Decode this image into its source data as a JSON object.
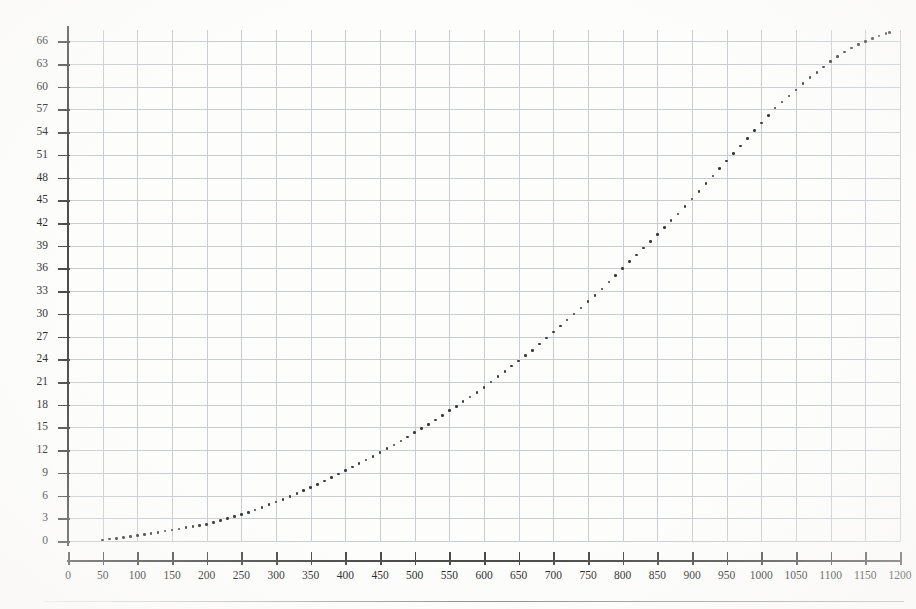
{
  "figure": {
    "kind": "scanned-scatter-plot",
    "background_color": "#fdfdfc",
    "grid_color": "#c9cdd3",
    "axis_color": "#4a4a4a",
    "marker_color": "#3a3a3a"
  },
  "chart_data": {
    "type": "scatter",
    "title": "",
    "subtitle": "",
    "xlabel": "",
    "ylabel": "",
    "xlim": [
      0,
      1200
    ],
    "ylim": [
      0,
      67.5
    ],
    "grid": true,
    "legend": null,
    "annotations": [],
    "xticks": [
      0,
      50,
      100,
      150,
      200,
      250,
      300,
      350,
      400,
      450,
      500,
      550,
      600,
      650,
      700,
      750,
      800,
      850,
      900,
      950,
      1000,
      1050,
      1100,
      1150,
      1200
    ],
    "xtick_labels": [
      "0",
      "50",
      "100",
      "150",
      "200",
      "250",
      "300",
      "350",
      "400",
      "450",
      "500",
      "550",
      "600",
      "650",
      "700",
      "750",
      "800",
      "850",
      "900",
      "950",
      "1000",
      "1050",
      "1100",
      "1150",
      "1200"
    ],
    "yticks": [
      0,
      3,
      6,
      9,
      12,
      15,
      18,
      21,
      24,
      27,
      30,
      33,
      36,
      39,
      42,
      45,
      48,
      51,
      54,
      57,
      60,
      63,
      66
    ],
    "ytick_labels": [
      "0",
      "3",
      "6",
      "9",
      "12",
      "15",
      "18",
      "21",
      "24",
      "27",
      "30",
      "33",
      "36",
      "39",
      "42",
      "45",
      "48",
      "51",
      "54",
      "57",
      "60",
      "63",
      "66"
    ],
    "x": [
      50,
      60,
      70,
      80,
      90,
      100,
      110,
      120,
      130,
      140,
      150,
      160,
      170,
      180,
      190,
      200,
      210,
      220,
      230,
      240,
      250,
      260,
      270,
      280,
      290,
      300,
      310,
      320,
      330,
      340,
      350,
      360,
      370,
      380,
      390,
      400,
      410,
      420,
      430,
      440,
      450,
      460,
      470,
      480,
      490,
      500,
      510,
      520,
      530,
      540,
      550,
      560,
      570,
      580,
      590,
      600,
      610,
      620,
      630,
      640,
      650,
      660,
      670,
      680,
      690,
      700,
      710,
      720,
      730,
      740,
      750,
      760,
      770,
      780,
      790,
      800,
      810,
      820,
      830,
      840,
      850,
      860,
      870,
      880,
      890,
      900,
      910,
      920,
      930,
      940,
      950,
      960,
      970,
      980,
      990,
      1000,
      1010,
      1020,
      1030,
      1040,
      1050,
      1060,
      1070,
      1080,
      1090,
      1100,
      1110,
      1120,
      1130,
      1140,
      1150,
      1160,
      1170,
      1180,
      1185
    ],
    "y": [
      0.15,
      0.25,
      0.35,
      0.45,
      0.58,
      0.7,
      0.85,
      1.0,
      1.15,
      1.3,
      1.45,
      1.6,
      1.75,
      1.9,
      2.05,
      2.2,
      2.45,
      2.7,
      2.95,
      3.2,
      3.5,
      3.8,
      4.1,
      4.45,
      4.8,
      5.15,
      5.5,
      5.9,
      6.3,
      6.7,
      7.1,
      7.5,
      7.95,
      8.4,
      8.85,
      9.3,
      9.75,
      10.2,
      10.7,
      11.2,
      11.7,
      12.2,
      12.7,
      13.2,
      13.75,
      14.3,
      14.85,
      15.4,
      16.0,
      16.6,
      17.2,
      17.8,
      18.4,
      19.0,
      19.6,
      20.3,
      21.0,
      21.7,
      22.4,
      23.1,
      23.8,
      24.5,
      25.2,
      26.0,
      26.8,
      27.6,
      28.4,
      29.2,
      30.0,
      30.8,
      31.6,
      32.4,
      33.3,
      34.2,
      35.1,
      36.0,
      36.9,
      37.8,
      38.7,
      39.6,
      40.5,
      41.4,
      42.3,
      43.2,
      44.2,
      45.2,
      46.2,
      47.2,
      48.2,
      49.2,
      50.2,
      51.2,
      52.2,
      53.2,
      54.2,
      55.2,
      56.2,
      57.2,
      58.0,
      58.8,
      59.6,
      60.4,
      61.2,
      61.9,
      62.6,
      63.3,
      64.0,
      64.6,
      65.1,
      65.6,
      66.0,
      66.4,
      66.7,
      67.0,
      67.2
    ]
  }
}
